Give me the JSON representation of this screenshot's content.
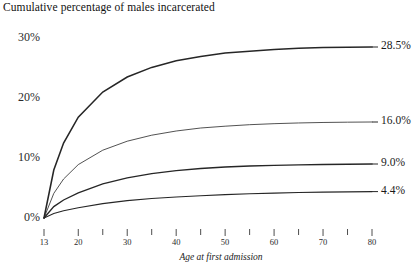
{
  "chart_title": "Cumulative percentage of males incarcerated",
  "axes": {
    "xlabel": "Age at first admission",
    "ylabel": "",
    "y_ticks": [
      "0%",
      "10%",
      "20%",
      "30%"
    ],
    "x_ticks_labeled": [
      "13",
      "20",
      "30",
      "40",
      "50",
      "60",
      "70",
      "80"
    ],
    "x_ticks_minor": [
      "25",
      "35",
      "45",
      "55",
      "65",
      "75"
    ]
  },
  "end_labels": [
    "28.5%",
    "16.0%",
    "9.0%",
    "4.4%"
  ],
  "chart_data": {
    "type": "line",
    "title": "Cumulative percentage of males incarcerated",
    "xlabel": "Age at first admission",
    "ylabel": "Cumulative percentage of males incarcerated",
    "xlim": [
      13,
      80
    ],
    "ylim": [
      0,
      32
    ],
    "grid": false,
    "legend": "right-end-labels",
    "xticks": [
      13,
      20,
      25,
      30,
      35,
      40,
      45,
      50,
      55,
      60,
      65,
      70,
      75,
      80
    ],
    "xticklabels": [
      "13",
      "20",
      "",
      "30",
      "",
      "40",
      "",
      "50",
      "",
      "60",
      "",
      "70",
      "",
      "80"
    ],
    "yticks": [
      0,
      10,
      20,
      30
    ],
    "yticklabels": [
      "0%",
      "10%",
      "20%",
      "30%"
    ],
    "x": [
      13,
      15,
      17,
      20,
      25,
      30,
      35,
      40,
      45,
      50,
      55,
      60,
      65,
      70,
      75,
      80
    ],
    "series": [
      {
        "name": "28.5%",
        "end_label": "28.5%",
        "final_value": 28.5,
        "values": [
          0,
          8.0,
          12.5,
          16.8,
          21.0,
          23.5,
          25.1,
          26.2,
          26.9,
          27.5,
          27.8,
          28.1,
          28.3,
          28.4,
          28.45,
          28.5
        ]
      },
      {
        "name": "16.0%",
        "end_label": "16.0%",
        "final_value": 16.0,
        "values": [
          0,
          4.1,
          6.5,
          8.9,
          11.3,
          12.8,
          13.8,
          14.5,
          15.0,
          15.3,
          15.55,
          15.72,
          15.84,
          15.92,
          15.97,
          16.0
        ]
      },
      {
        "name": "9.0%",
        "end_label": "9.0%",
        "final_value": 9.0,
        "values": [
          0,
          1.9,
          3.0,
          4.2,
          5.7,
          6.7,
          7.4,
          7.9,
          8.25,
          8.5,
          8.67,
          8.78,
          8.86,
          8.92,
          8.96,
          9.0
        ]
      },
      {
        "name": "4.4%",
        "end_label": "4.4%",
        "final_value": 4.4,
        "values": [
          0,
          0.75,
          1.2,
          1.7,
          2.4,
          2.9,
          3.25,
          3.5,
          3.72,
          3.9,
          4.03,
          4.14,
          4.24,
          4.31,
          4.36,
          4.4
        ]
      }
    ]
  }
}
